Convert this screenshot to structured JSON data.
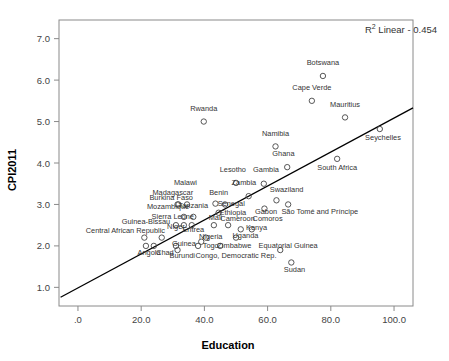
{
  "chart_data": {
    "type": "scatter",
    "title": "",
    "xlabel": "Education",
    "ylabel": "CPI2011",
    "xlim": [
      -6,
      106
    ],
    "ylim": [
      0.55,
      7.45
    ],
    "xticks": [
      0,
      20,
      40,
      60,
      80,
      100
    ],
    "xticklabels": [
      ".0",
      "20.0",
      "40.0",
      "60.0",
      "80.0",
      "100.0"
    ],
    "yticks": [
      1.0,
      2.0,
      3.0,
      4.0,
      5.0,
      6.0,
      7.0
    ],
    "yticklabels": [
      "1.0",
      "2.0",
      "3.0",
      "4.0",
      "5.0",
      "6.0",
      "7.0"
    ],
    "grid": false,
    "legend": "none",
    "annotation": "R² Linear - 0.454",
    "annotation_prefix": "R",
    "annotation_sup": "2",
    "annotation_suffix": " Linear - 0.454",
    "fit_line": {
      "type": "linear",
      "r_squared": 0.454,
      "x_start": -5.5,
      "y_start": 0.76,
      "x_end": 106.0,
      "y_end": 5.33
    },
    "points": [
      {
        "label": "Botswana",
        "x": 77.5,
        "y": 6.1,
        "lx": 77.5,
        "ly": 6.36,
        "anchor": "middle"
      },
      {
        "label": "Cape Verde",
        "x": 74.0,
        "y": 5.5,
        "lx": 74.0,
        "ly": 5.76,
        "anchor": "middle"
      },
      {
        "label": "Mauritius",
        "x": 84.5,
        "y": 5.1,
        "lx": 84.5,
        "ly": 5.36,
        "anchor": "middle"
      },
      {
        "label": "Rwanda",
        "x": 39.8,
        "y": 5.0,
        "lx": 39.8,
        "ly": 5.26,
        "anchor": "middle"
      },
      {
        "label": "Seychelles",
        "x": 95.5,
        "y": 4.82,
        "lx": 96.5,
        "ly": 4.56,
        "anchor": "middle"
      },
      {
        "label": "Namibia",
        "x": 62.5,
        "y": 4.4,
        "lx": 62.5,
        "ly": 4.66,
        "anchor": "middle"
      },
      {
        "label": "South Africa",
        "x": 82.0,
        "y": 4.1,
        "lx": 82.0,
        "ly": 3.84,
        "anchor": "middle"
      },
      {
        "label": "Ghana",
        "x": 66.2,
        "y": 3.9,
        "lx": 65.0,
        "ly": 4.16,
        "anchor": "middle"
      },
      {
        "label": "Lesotho",
        "x": 50.0,
        "y": 3.52,
        "lx": 49.0,
        "ly": 3.78,
        "anchor": "middle"
      },
      {
        "label": "Gambia",
        "x": 58.8,
        "y": 3.5,
        "lx": 59.5,
        "ly": 3.78,
        "anchor": "middle"
      },
      {
        "label": "Zambia",
        "x": 54.0,
        "y": 3.2,
        "lx": 52.5,
        "ly": 3.46,
        "anchor": "middle"
      },
      {
        "label": "Swaziland",
        "x": 62.8,
        "y": 3.1,
        "lx": 66.0,
        "ly": 3.3,
        "anchor": "middle"
      },
      {
        "label": "Malawi",
        "x": 34.5,
        "y": 3.0,
        "lx": 34.0,
        "ly": 3.46,
        "anchor": "middle"
      },
      {
        "label": "Madagascar",
        "x": 31.5,
        "y": 3.0,
        "lx": 30.0,
        "ly": 3.22,
        "anchor": "middle"
      },
      {
        "label": "Benin",
        "x": 43.5,
        "y": 3.02,
        "lx": 44.5,
        "ly": 3.22,
        "anchor": "middle"
      },
      {
        "label": "Burkina Faso",
        "x": 31.8,
        "y": 3.0,
        "lx": 29.5,
        "ly": 3.1,
        "anchor": "middle"
      },
      {
        "label": "São Tomé and Príncipe",
        "x": 66.5,
        "y": 3.0,
        "lx": 76.5,
        "ly": 2.78,
        "anchor": "middle"
      },
      {
        "label": "Senegal",
        "x": 46.5,
        "y": 3.0,
        "lx": 48.5,
        "ly": 2.96,
        "anchor": "middle"
      },
      {
        "label": "Mozambique",
        "x": 33.5,
        "y": 2.7,
        "lx": 28.5,
        "ly": 2.88,
        "anchor": "middle"
      },
      {
        "label": "Tanzania",
        "x": 36.5,
        "y": 2.7,
        "lx": 36.5,
        "ly": 2.92,
        "anchor": "middle"
      },
      {
        "label": "Ethiopia",
        "x": 44.5,
        "y": 2.8,
        "lx": 49.0,
        "ly": 2.74,
        "anchor": "middle"
      },
      {
        "label": "Gabon",
        "x": 59.0,
        "y": 2.9,
        "lx": 59.5,
        "ly": 2.78,
        "anchor": "middle"
      },
      {
        "label": "Sierra Leone",
        "x": 31.0,
        "y": 2.5,
        "lx": 30.0,
        "ly": 2.66,
        "anchor": "middle"
      },
      {
        "label": "Mali",
        "x": 43.0,
        "y": 2.5,
        "lx": 43.5,
        "ly": 2.62,
        "anchor": "middle"
      },
      {
        "label": "Cameroon",
        "x": 47.5,
        "y": 2.5,
        "lx": 50.5,
        "ly": 2.6,
        "anchor": "middle"
      },
      {
        "label": "Comoros",
        "x": 55.0,
        "y": 2.4,
        "lx": 60.0,
        "ly": 2.6,
        "anchor": "middle"
      },
      {
        "label": "Guinea-Bissau",
        "x": 26.5,
        "y": 2.2,
        "lx": 21.5,
        "ly": 2.52,
        "anchor": "middle"
      },
      {
        "label": "Niger",
        "x": 33.5,
        "y": 2.5,
        "lx": 31.0,
        "ly": 2.4,
        "anchor": "middle"
      },
      {
        "label": "Eritrea",
        "x": 36.0,
        "y": 2.5,
        "lx": 36.5,
        "ly": 2.34,
        "anchor": "middle"
      },
      {
        "label": "Kenya",
        "x": 51.5,
        "y": 2.4,
        "lx": 56.5,
        "ly": 2.38,
        "anchor": "middle"
      },
      {
        "label": "Central African Republic",
        "x": 21.0,
        "y": 2.2,
        "lx": 15.0,
        "ly": 2.32,
        "anchor": "middle"
      },
      {
        "label": "Nigeria",
        "x": 40.5,
        "y": 2.2,
        "lx": 42.0,
        "ly": 2.16,
        "anchor": "middle"
      },
      {
        "label": "Uganda",
        "x": 50.0,
        "y": 2.2,
        "lx": 53.0,
        "ly": 2.18,
        "anchor": "middle"
      },
      {
        "label": "Guinea",
        "x": 31.0,
        "y": 2.0,
        "lx": 33.5,
        "ly": 2.0,
        "anchor": "middle"
      },
      {
        "label": "Togo",
        "x": 38.0,
        "y": 2.0,
        "lx": 42.0,
        "ly": 1.96,
        "anchor": "middle"
      },
      {
        "label": "Zimbabwe",
        "x": 39.0,
        "y": 2.1,
        "lx": 49.5,
        "ly": 1.96,
        "anchor": "middle"
      },
      {
        "label": "Equatorial Guinea",
        "x": 64.0,
        "y": 1.9,
        "lx": 66.5,
        "ly": 1.96,
        "anchor": "middle"
      },
      {
        "label": "Angola",
        "x": 21.5,
        "y": 2.0,
        "lx": 22.5,
        "ly": 1.78,
        "anchor": "middle"
      },
      {
        "label": "Chad",
        "x": 24.0,
        "y": 2.0,
        "lx": 27.5,
        "ly": 1.78,
        "anchor": "middle"
      },
      {
        "label": "Burundi",
        "x": 31.5,
        "y": 1.9,
        "lx": 33.0,
        "ly": 1.7,
        "anchor": "middle"
      },
      {
        "label": "Congo, Democratic Rep.",
        "x": 45.0,
        "y": 2.0,
        "lx": 50.0,
        "ly": 1.72,
        "anchor": "middle"
      },
      {
        "label": "Sudan",
        "x": 67.5,
        "y": 1.6,
        "lx": 68.5,
        "ly": 1.36,
        "anchor": "middle"
      }
    ]
  }
}
